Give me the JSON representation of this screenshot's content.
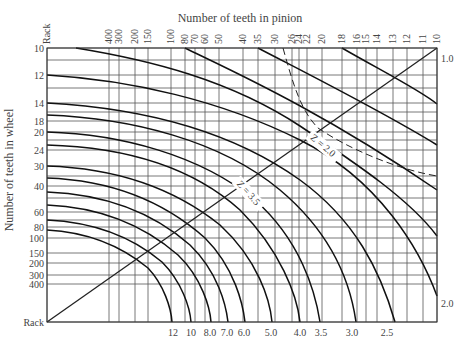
{
  "diagram": {
    "top_title": "Number of teeth in pinion",
    "left_title": "Number of teeth in wheel",
    "plot": {
      "left": 47,
      "top": 48,
      "right": 437,
      "bottom": 322
    },
    "pinion_ticks": [
      {
        "label": "Rack",
        "x": 47
      },
      {
        "label": "400",
        "x": 109
      },
      {
        "label": "300",
        "x": 119
      },
      {
        "label": "200",
        "x": 135
      },
      {
        "label": "150",
        "x": 148
      },
      {
        "label": "100",
        "x": 171
      },
      {
        "label": "80",
        "x": 185
      },
      {
        "label": "70",
        "x": 195
      },
      {
        "label": "60",
        "x": 205
      },
      {
        "label": "50",
        "x": 219
      },
      {
        "label": "40",
        "x": 243
      },
      {
        "label": "35",
        "x": 258
      },
      {
        "label": "30",
        "x": 275
      },
      {
        "label": "26",
        "x": 292
      },
      {
        "label": "24",
        "x": 299
      },
      {
        "label": "22",
        "x": 307
      },
      {
        "label": "20",
        "x": 322
      },
      {
        "label": "18",
        "x": 342
      },
      {
        "label": "16",
        "x": 357
      },
      {
        "label": "15",
        "x": 366
      },
      {
        "label": "14",
        "x": 377
      },
      {
        "label": "13",
        "x": 393
      },
      {
        "label": "12",
        "x": 407
      },
      {
        "label": "11",
        "x": 423
      },
      {
        "label": "10",
        "x": 437
      }
    ],
    "wheel_ticks": [
      {
        "label": "10",
        "y": 48
      },
      {
        "label": "",
        "y": 60
      },
      {
        "label": "12",
        "y": 75
      },
      {
        "label": "",
        "y": 88
      },
      {
        "label": "14",
        "y": 103
      },
      {
        "label": "",
        "y": 112
      },
      {
        "label": "18",
        "y": 121
      },
      {
        "label": "20",
        "y": 132
      },
      {
        "label": "",
        "y": 140
      },
      {
        "label": "24",
        "y": 150
      },
      {
        "label": "30",
        "y": 166
      },
      {
        "label": "",
        "y": 176
      },
      {
        "label": "40",
        "y": 186
      },
      {
        "label": "",
        "y": 198
      },
      {
        "label": "60",
        "y": 212
      },
      {
        "label": "",
        "y": 220
      },
      {
        "label": "80",
        "y": 227
      },
      {
        "label": "100",
        "y": 238
      },
      {
        "label": "150",
        "y": 253
      },
      {
        "label": "200",
        "y": 263
      },
      {
        "label": "300",
        "y": 275
      },
      {
        "label": "400",
        "y": 284
      },
      {
        "label": "Rack",
        "y": 322
      }
    ],
    "bottom_labels": [
      {
        "label": "12",
        "x": 173
      },
      {
        "label": "10",
        "x": 191
      },
      {
        "label": "8.0",
        "x": 210
      },
      {
        "label": "7.0",
        "x": 227
      },
      {
        "label": "6.0",
        "x": 244
      },
      {
        "label": "5.0",
        "x": 271
      },
      {
        "label": "4.0",
        "x": 300
      },
      {
        "label": "3.5",
        "x": 321
      },
      {
        "label": "3.0",
        "x": 352
      },
      {
        "label": "2.5",
        "x": 387
      }
    ],
    "right_labels": [
      {
        "label": "1.0",
        "y": 58
      },
      {
        "label": "2.0",
        "y": 303
      }
    ],
    "z_labels": [
      {
        "label": "Z = 2.0",
        "x": 321,
        "y": 148,
        "rotate": 40
      },
      {
        "label": "Z = 3.5",
        "x": 246,
        "y": 195,
        "rotate": 48
      }
    ],
    "diagonal": {
      "x1": 47,
      "y1": 322,
      "x2": 437,
      "y2": 48
    },
    "curves": [
      "M 76 48 C 150 60, 230 80, 300 126 C 360 166, 410 200, 437 236",
      "M 185 48 C 230 70, 320 110, 437 190",
      "M 258 48 C 300 70, 380 110, 437 145",
      "M 342 48 C 380 70, 420 90, 437 104",
      "M 47 75 C 130 80, 220 100, 300 140 C 380 180, 420 250, 437 296",
      "M 47 103 C 140 108, 230 130, 300 180 C 355 220, 380 270, 395 322",
      "M 47 115 C 130 118, 220 140, 280 190 C 330 232, 350 280, 356 322",
      "M 47 132 C 120 134, 200 155, 255 200 C 300 240, 315 290, 320 322",
      "M 47 145 C 120 147, 190 165, 240 210 C 280 250, 297 295, 300 322",
      "M 47 166 C 110 168, 170 185, 220 225 C 258 260, 270 300, 272 322",
      "M 47 178 C 105 180, 160 198, 205 238 C 235 268, 243 305, 245 322",
      "M 47 192 C 100 194, 150 210, 190 245 C 218 272, 226 305, 228 322",
      "M 47 205 C 95 207, 140 222, 178 255 C 202 278, 210 308, 211 322",
      "M 47 220 C 90 222, 130 235, 162 262 C 182 282, 190 308, 191 322",
      "M 47 230 C 85 232, 120 245, 148 268 C 164 285, 171 308, 172 322"
    ],
    "dashed_curves": [
      "M 283 48 C 292 80, 300 110, 318 128 C 350 150, 400 170, 437 176"
    ]
  }
}
